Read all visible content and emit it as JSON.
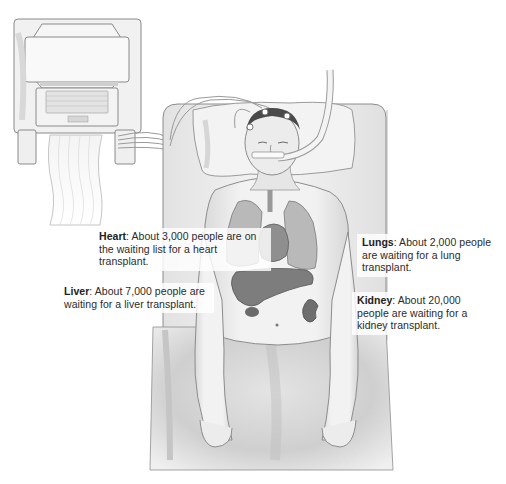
{
  "labels": {
    "heart": {
      "organ": "Heart",
      "text": ": About 3,000 people are on the waiting list for a heart transplant."
    },
    "lungs": {
      "organ": "Lungs",
      "text": ": About 2,000 people are waiting for a lung transplant."
    },
    "liver": {
      "organ": "Liver",
      "text": ": About 7,000 people are waiting for a liver transplant."
    },
    "kidney": {
      "organ": "Kidney",
      "text": ": About 20,000 people are waiting for a kidney transplant."
    }
  },
  "illustration": {
    "subject": "patient on ventilator in hospital bed",
    "elements": [
      "monitor-machine",
      "printout-paper",
      "hospital-bed",
      "pillow",
      "patient",
      "breathing-tube",
      "electrodes",
      "lungs",
      "heart",
      "liver",
      "kidney",
      "blanket"
    ]
  }
}
